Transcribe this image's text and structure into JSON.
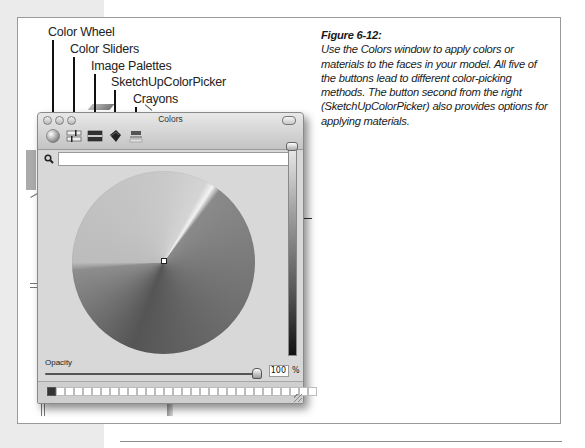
{
  "callouts": [
    {
      "label": "Color Wheel",
      "target": "color-wheel-tab"
    },
    {
      "label": "Color Sliders",
      "target": "color-sliders-tab"
    },
    {
      "label": "Image Palettes",
      "target": "image-palettes-tab"
    },
    {
      "label": "SketchUpColorPicker",
      "target": "sketchup-color-picker-tab"
    },
    {
      "label": "Crayons",
      "target": "crayons-tab"
    }
  ],
  "caption": {
    "title": "Figure 6-12:",
    "body": "Use the Colors window to apply colors or materials to the faces in your model. All five of the buttons lead to different color-picking methods. The button second from the right (SketchUpColorPicker) also provides options for applying materials."
  },
  "window": {
    "title": "Colors",
    "toolbar": [
      {
        "name": "color-wheel",
        "icon": "color-wheel-icon"
      },
      {
        "name": "color-sliders",
        "icon": "color-sliders-icon"
      },
      {
        "name": "image-palettes",
        "icon": "image-palettes-icon"
      },
      {
        "name": "sketchup-color-picker",
        "icon": "paint-bucket-icon"
      },
      {
        "name": "crayons",
        "icon": "crayons-icon"
      }
    ],
    "search": {
      "value": "",
      "placeholder": ""
    },
    "opacity": {
      "label": "Opacity",
      "value": "100",
      "unit": "%"
    },
    "swatches": {
      "count": 30,
      "filled_index": 0,
      "filled_color": "#333333"
    }
  },
  "colors": {
    "frame_border": "#9a9a9a",
    "left_strip": "#ebebeb",
    "window_bg": "#d8d8d8"
  }
}
